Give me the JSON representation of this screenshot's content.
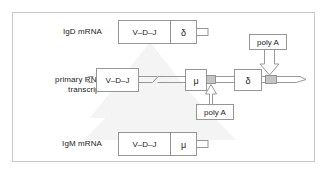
{
  "figure": {
    "border_color": "#c9c9c9",
    "line_color": "#8d8d8d",
    "text_color": "#1b1b1b",
    "shaded_color": "#c4c4c4"
  },
  "rows": {
    "igd": {
      "label": "IgD mRNA",
      "segments": [
        {
          "name": "vdj",
          "text": "V–D–J"
        },
        {
          "name": "delta",
          "text": "δ"
        }
      ],
      "tail": "poly-A-tail"
    },
    "primary": {
      "label": "primary RNA\ntranscript",
      "label_line1": "primary RNA",
      "label_line2": "transcript",
      "segments": [
        {
          "name": "vdj",
          "text": "V–D–J"
        },
        {
          "name": "mu",
          "text": "μ"
        },
        {
          "name": "delta",
          "text": "δ"
        }
      ],
      "break_symbol": "strand-break",
      "left_cap": "strand-left-cap",
      "right_end": "strand-right-open-end"
    },
    "igm": {
      "label": "IgM mRNA",
      "segments": [
        {
          "name": "vdj",
          "text": "V–D–J"
        },
        {
          "name": "mu",
          "text": "μ"
        }
      ],
      "tail": "poly-A-tail"
    }
  },
  "annotations": [
    {
      "name": "poly-a-right",
      "text": "poly A",
      "points_to": "delta-polyA-site"
    },
    {
      "name": "poly-a-left",
      "text": "poly A",
      "points_to": "mu-polyA-site"
    }
  ]
}
